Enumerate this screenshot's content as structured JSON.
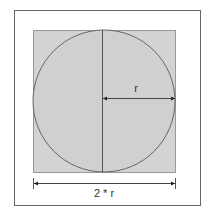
{
  "diagram": {
    "title": "",
    "labels": {
      "radius": "r",
      "diameter": "2 * r"
    },
    "colors": {
      "background": "#ffffff",
      "frame": "#666666",
      "square_fill": "#d3d3d3",
      "square_stroke": "#999999",
      "circle_stroke": "#666666",
      "line": "#444444",
      "text": "#333333"
    },
    "shapes": {
      "frame": {
        "x": 14,
        "y": 10,
        "w": 186,
        "h": 195
      },
      "square": {
        "x": 33,
        "y": 30,
        "w": 142,
        "h": 142
      },
      "circle": {
        "cx": 104,
        "cy": 101,
        "r": 71
      },
      "vertical_line": {
        "x": 102,
        "y1": 30,
        "y2": 172
      },
      "radius_arrow": {
        "y": 98,
        "x1": 103,
        "x2": 175
      },
      "diameter_arrow": {
        "y": 183,
        "x1": 33,
        "x2": 175
      }
    }
  }
}
